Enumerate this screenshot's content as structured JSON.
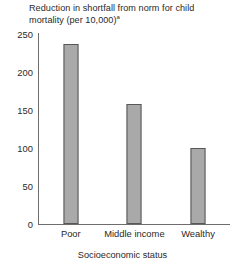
{
  "chart_data": {
    "type": "bar",
    "title": "Reduction in shortfall from norm for child mortality (per 10,000)",
    "title_superscript": "a",
    "title_line1": "Reduction in shortfall from norm for child",
    "title_line2": "mortality (per 10,000)",
    "xlabel": "Socioeconomic status",
    "ylabel": "",
    "categories": [
      "Poor",
      "Middle income",
      "Wealthy"
    ],
    "values": [
      237,
      158,
      100
    ],
    "ylim": [
      0,
      250
    ],
    "yticks": [
      250,
      200,
      150,
      100,
      50,
      0
    ],
    "ytick_labels": [
      "250",
      "200",
      "150",
      "100",
      "50",
      "0"
    ],
    "grid": false,
    "legend": null,
    "bar_color": "#a9a9a9",
    "bar_border_color": "#575757",
    "axis_color": "#6d6d6d",
    "text_color": "#2a2a2a",
    "background": "#ffffff"
  }
}
